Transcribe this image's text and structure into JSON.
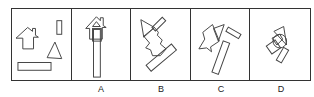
{
  "puzzle": {
    "question_panel": {
      "shapes": [
        "house-pentagon",
        "small-vertical-rectangle",
        "triangle",
        "long-horizontal-rectangle"
      ]
    },
    "options": [
      {
        "label": "A"
      },
      {
        "label": "B"
      },
      {
        "label": "C"
      },
      {
        "label": "D"
      }
    ]
  }
}
